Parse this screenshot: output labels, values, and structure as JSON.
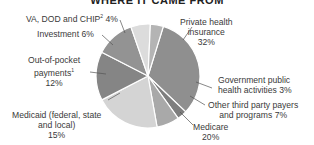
{
  "title": "WHERE IT CAME FROM",
  "chart_data": {
    "type": "pie",
    "title": "WHERE IT CAME FROM",
    "unit": "%",
    "slices": [
      {
        "label": "Private health insurance",
        "value": 32,
        "color": "#8f8f8f"
      },
      {
        "label": "Government public health activities",
        "value": 3,
        "color": "#7e7e7e"
      },
      {
        "label": "Other third party payers and programs",
        "value": 7,
        "color": "#a9a9a9"
      },
      {
        "label": "Medicare",
        "value": 20,
        "color": "#d4d4d4"
      },
      {
        "label": "Medicaid (federal, state and local)",
        "value": 15,
        "color": "#858585"
      },
      {
        "label": "Out-of-pocket payments",
        "value": 12,
        "color": "#939393",
        "footnote": "1"
      },
      {
        "label": "Investment",
        "value": 6,
        "color": "#dcdcdc"
      },
      {
        "label": "VA, DOD and CHIP",
        "value": 4,
        "color": "#b4b4b4",
        "footnote": "2"
      }
    ]
  },
  "labels": {
    "private": {
      "line1": "Private health",
      "line2": "insurance",
      "value": "32%"
    },
    "govpublic": {
      "line1": "Government public",
      "line2": "health activities  3%"
    },
    "other": {
      "line1": "Other third party payers",
      "line2": "and programs  7%"
    },
    "medicare": {
      "line1": "Medicare",
      "value": "20%"
    },
    "medicaid": {
      "line1": "Medicaid (federal, state",
      "line2": "and local)",
      "value": "15%"
    },
    "oop": {
      "line1": "Out-of-pocket",
      "line2": "payments",
      "sup": "1",
      "value": "12%"
    },
    "investment": {
      "line1": "Investment 6%"
    },
    "va": {
      "line1": "VA, DOD and CHIP",
      "sup": "2",
      "value": " 4%"
    }
  }
}
